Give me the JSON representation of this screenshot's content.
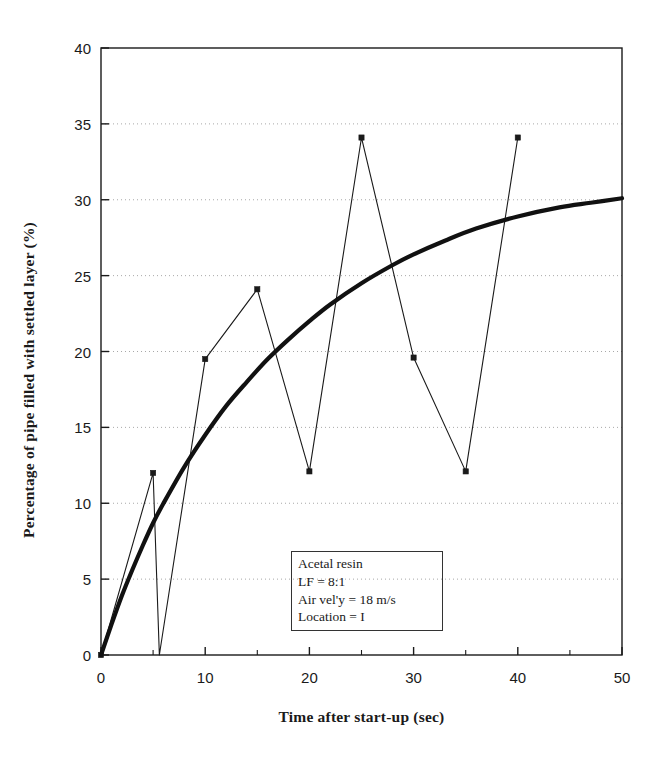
{
  "chart_data": {
    "type": "line",
    "title": "",
    "xlabel": "Time after start-up (sec)",
    "ylabel": "Percentage of pipe filled with settled layer (%)",
    "xlim": [
      0,
      50
    ],
    "ylim": [
      0,
      40
    ],
    "xticks": [
      0,
      10,
      20,
      30,
      40,
      50
    ],
    "xtick_labels": [
      "0",
      "10",
      "20",
      "30",
      "40",
      "50"
    ],
    "xminorticks": [
      5,
      15,
      25,
      35,
      45
    ],
    "yticks": [
      0,
      5,
      10,
      15,
      20,
      25,
      30,
      35,
      40
    ],
    "ytick_labels": [
      "0",
      "5",
      "10",
      "15",
      "20",
      "25",
      "30",
      "35",
      "40"
    ],
    "grid": "horizontal-dotted",
    "legend": "none",
    "series": [
      {
        "name": "Measured data",
        "style": "thin-line-with-square-markers",
        "color": "#1a1a1a",
        "points": [
          {
            "x": 0,
            "y": 0
          },
          {
            "x": 5,
            "y": 12.0
          },
          {
            "x": 5.6,
            "y": 0
          },
          {
            "x": 10,
            "y": 19.5
          },
          {
            "x": 15,
            "y": 24.1
          },
          {
            "x": 20,
            "y": 12.1
          },
          {
            "x": 25,
            "y": 34.1
          },
          {
            "x": 30,
            "y": 19.6
          },
          {
            "x": 35,
            "y": 12.1
          },
          {
            "x": 40,
            "y": 34.1
          }
        ]
      },
      {
        "name": "Model prediction",
        "style": "thick-smooth-curve",
        "color": "#111111",
        "points": [
          {
            "x": 0,
            "y": 0
          },
          {
            "x": 1,
            "y": 2.0
          },
          {
            "x": 2,
            "y": 3.9
          },
          {
            "x": 3,
            "y": 5.6
          },
          {
            "x": 4,
            "y": 7.2
          },
          {
            "x": 5,
            "y": 8.7
          },
          {
            "x": 6,
            "y": 10.0
          },
          {
            "x": 8,
            "y": 12.4
          },
          {
            "x": 10,
            "y": 14.5
          },
          {
            "x": 12,
            "y": 16.4
          },
          {
            "x": 14,
            "y": 18.0
          },
          {
            "x": 16,
            "y": 19.5
          },
          {
            "x": 18,
            "y": 20.8
          },
          {
            "x": 20,
            "y": 22.0
          },
          {
            "x": 22,
            "y": 23.1
          },
          {
            "x": 25,
            "y": 24.5
          },
          {
            "x": 28,
            "y": 25.7
          },
          {
            "x": 30,
            "y": 26.4
          },
          {
            "x": 33,
            "y": 27.3
          },
          {
            "x": 36,
            "y": 28.1
          },
          {
            "x": 40,
            "y": 28.9
          },
          {
            "x": 44,
            "y": 29.5
          },
          {
            "x": 47,
            "y": 29.8
          },
          {
            "x": 50,
            "y": 30.1
          }
        ]
      }
    ]
  },
  "annotation": {
    "lines": [
      "Acetal resin",
      "LF = 8:1",
      "Air vel'y = 18 m/s",
      "Location = I"
    ]
  },
  "colors": {
    "ink": "#1a1a1a",
    "grid": "#999999",
    "background": "#ffffff"
  }
}
